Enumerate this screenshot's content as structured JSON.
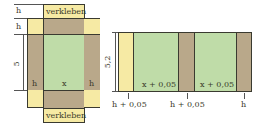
{
  "left_net": {
    "labels": {
      "top_tab": "verkleben",
      "bottom_tab": "verkleben",
      "row_h_top": "h",
      "row_h_second": "h",
      "height_dim": "5",
      "left_panel": "h",
      "center_panel": "x",
      "right_panel": "h"
    }
  },
  "right_strip": {
    "height_dim": "5,2",
    "panels": [
      {
        "color": "yellow",
        "label": ""
      },
      {
        "color": "green",
        "label": "x + 0,05"
      },
      {
        "color": "tan",
        "label": ""
      },
      {
        "color": "green",
        "label": "x + 0,05"
      },
      {
        "color": "tan",
        "label": ""
      }
    ],
    "markers": [
      "h + 0,05",
      "h + 0,05",
      "h"
    ]
  },
  "colors": {
    "yellow": "#f6eaa4",
    "tan": "#b9a88a",
    "green": "#bfdca8",
    "border": "#3a3a30"
  }
}
